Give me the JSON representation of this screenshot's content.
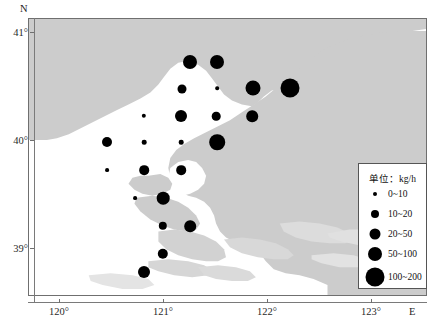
{
  "figure": {
    "type": "bubble-map",
    "width": 439,
    "height": 329,
    "background_color": "#ffffff",
    "land_color": "#cccccc",
    "sea_color": "#ffffff",
    "dot_color": "#000000",
    "frame_color": "#6f6f6f"
  },
  "axes": {
    "y_axis_label": "N",
    "x_axis_label": "E",
    "x_ticks": [
      {
        "label": "120°",
        "value": 120,
        "px": 59
      },
      {
        "label": "121°",
        "value": 121,
        "px": 163
      },
      {
        "label": "122°",
        "value": 122,
        "px": 267
      },
      {
        "label": "123°",
        "value": 123,
        "px": 371
      }
    ],
    "y_ticks": [
      {
        "label": "41°",
        "value": 41,
        "px": 32
      },
      {
        "label": "40°",
        "value": 40,
        "px": 140
      },
      {
        "label": "39°",
        "value": 39,
        "px": 248
      }
    ],
    "x_range": [
      119.7,
      123.55
    ],
    "y_range": [
      38.55,
      41.13
    ]
  },
  "legend": {
    "title": "单位：kg/h",
    "box": {
      "left": 358,
      "top": 163,
      "width": 69,
      "height": 126
    },
    "entries": [
      {
        "label": "0~10",
        "radius_px": 2.0,
        "min": 0,
        "max": 10
      },
      {
        "label": "10~20",
        "radius_px": 4.0,
        "min": 10,
        "max": 20
      },
      {
        "label": "20~50",
        "radius_px": 5.5,
        "min": 20,
        "max": 50
      },
      {
        "label": "50~100",
        "radius_px": 7.0,
        "min": 50,
        "max": 100
      },
      {
        "label": "100~200",
        "radius_px": 9.5,
        "min": 100,
        "max": 200
      }
    ]
  },
  "chart_data": {
    "type": "scatter",
    "title": "",
    "xlabel": "E",
    "ylabel": "N",
    "unit": "kg/h",
    "points": [
      {
        "lon_px": 190,
        "lat_px": 62,
        "r": 7.0,
        "class": "50~100"
      },
      {
        "lon_px": 217,
        "lat_px": 62,
        "r": 7.0,
        "class": "50~100"
      },
      {
        "lon_px": 182,
        "lat_px": 89,
        "r": 4.5,
        "class": "20~50"
      },
      {
        "lon_px": 217,
        "lat_px": 88,
        "r": 1.8,
        "class": "0~10"
      },
      {
        "lon_px": 253,
        "lat_px": 88,
        "r": 7.5,
        "class": "50~100"
      },
      {
        "lon_px": 290,
        "lat_px": 88,
        "r": 9.5,
        "class": "100~200"
      },
      {
        "lon_px": 144,
        "lat_px": 116,
        "r": 2.2,
        "class": "0~10"
      },
      {
        "lon_px": 181,
        "lat_px": 116,
        "r": 6.0,
        "class": "20~50"
      },
      {
        "lon_px": 216,
        "lat_px": 116,
        "r": 4.3,
        "class": "10~20"
      },
      {
        "lon_px": 252,
        "lat_px": 116,
        "r": 5.8,
        "class": "20~50"
      },
      {
        "lon_px": 107,
        "lat_px": 142,
        "r": 5.0,
        "class": "20~50"
      },
      {
        "lon_px": 144,
        "lat_px": 142,
        "r": 2.3,
        "class": "0~10"
      },
      {
        "lon_px": 181,
        "lat_px": 142,
        "r": 2.3,
        "class": "0~10"
      },
      {
        "lon_px": 217,
        "lat_px": 142,
        "r": 7.8,
        "class": "50~100"
      },
      {
        "lon_px": 107,
        "lat_px": 170,
        "r": 1.9,
        "class": "0~10"
      },
      {
        "lon_px": 144,
        "lat_px": 170,
        "r": 4.8,
        "class": "20~50"
      },
      {
        "lon_px": 181,
        "lat_px": 170,
        "r": 4.8,
        "class": "20~50"
      },
      {
        "lon_px": 135,
        "lat_px": 198,
        "r": 1.9,
        "class": "0~10"
      },
      {
        "lon_px": 163,
        "lat_px": 198,
        "r": 6.3,
        "class": "20~50"
      },
      {
        "lon_px": 163,
        "lat_px": 226,
        "r": 4.2,
        "class": "10~20"
      },
      {
        "lon_px": 190,
        "lat_px": 226,
        "r": 5.8,
        "class": "20~50"
      },
      {
        "lon_px": 163,
        "lat_px": 254,
        "r": 5.2,
        "class": "20~50"
      },
      {
        "lon_px": 144,
        "lat_px": 272,
        "r": 6.0,
        "class": "20~50"
      }
    ]
  }
}
